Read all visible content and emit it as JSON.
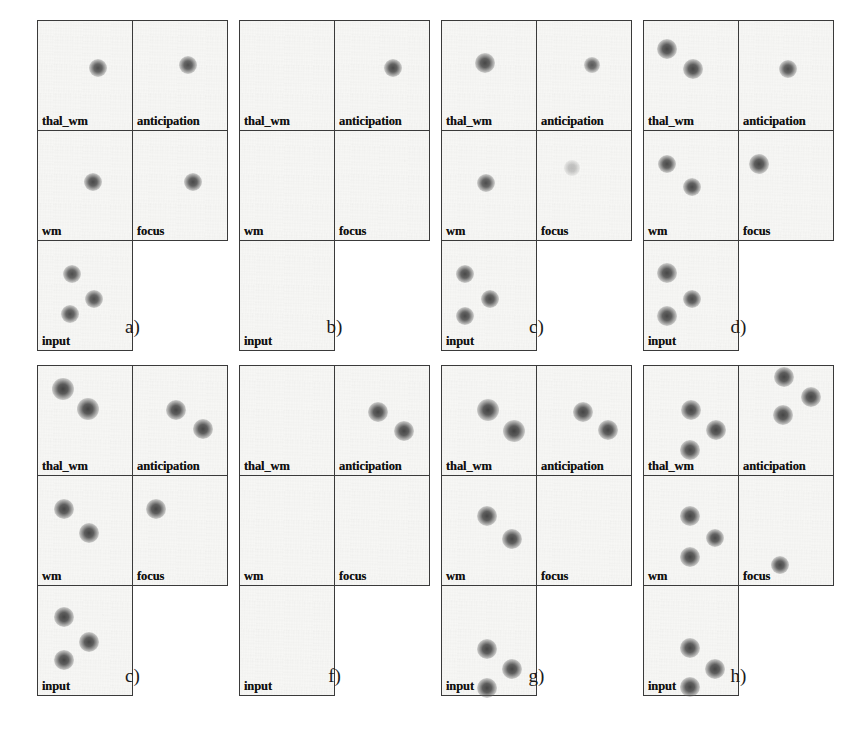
{
  "figure": {
    "cell_labels": [
      "thal_wm",
      "anticipation",
      "wm",
      "focus",
      "input"
    ],
    "blob_color": "#4a4a4a",
    "border_color": "#3a3a3a",
    "background_color": "#f7f7f5"
  },
  "chart_data": {
    "type": "scatter",
    "xlabel": "",
    "ylabel": "",
    "xlim": [
      0,
      100
    ],
    "ylim": [
      0,
      100
    ],
    "grid": false,
    "legend": "none",
    "modules": [
      "thal_wm",
      "anticipation",
      "wm",
      "focus",
      "input"
    ],
    "panels": [
      {
        "caption": "a)",
        "cells": [
          {
            "module": "thal_wm",
            "points": [
              {
                "x": 62,
                "y": 42,
                "r": 9,
                "i": 0.82
              }
            ]
          },
          {
            "module": "anticipation",
            "points": [
              {
                "x": 57,
                "y": 40,
                "r": 9,
                "i": 0.82
              }
            ]
          },
          {
            "module": "wm",
            "points": [
              {
                "x": 57,
                "y": 46,
                "r": 9,
                "i": 0.84
              }
            ]
          },
          {
            "module": "focus",
            "points": [
              {
                "x": 62,
                "y": 46,
                "r": 9,
                "i": 0.84
              }
            ]
          },
          {
            "module": "input",
            "points": [
              {
                "x": 35,
                "y": 30,
                "r": 9,
                "i": 0.82
              },
              {
                "x": 58,
                "y": 52,
                "r": 9,
                "i": 0.82
              },
              {
                "x": 33,
                "y": 66,
                "r": 9,
                "i": 0.82
              }
            ]
          }
        ]
      },
      {
        "caption": "b)",
        "cells": [
          {
            "module": "thal_wm",
            "points": []
          },
          {
            "module": "anticipation",
            "points": [
              {
                "x": 60,
                "y": 42,
                "r": 9,
                "i": 0.84
              }
            ]
          },
          {
            "module": "wm",
            "points": []
          },
          {
            "module": "focus",
            "points": []
          },
          {
            "module": "input",
            "points": []
          }
        ]
      },
      {
        "caption": "c)",
        "cells": [
          {
            "module": "thal_wm",
            "points": [
              {
                "x": 45,
                "y": 38,
                "r": 10,
                "i": 0.85
              }
            ]
          },
          {
            "module": "anticipation",
            "points": [
              {
                "x": 57,
                "y": 40,
                "r": 8,
                "i": 0.76
              }
            ]
          },
          {
            "module": "wm",
            "points": [
              {
                "x": 46,
                "y": 47,
                "r": 9,
                "i": 0.82
              }
            ]
          },
          {
            "module": "focus",
            "points": [
              {
                "x": 36,
                "y": 33,
                "r": 8,
                "i": 0.28
              }
            ]
          },
          {
            "module": "input",
            "points": [
              {
                "x": 24,
                "y": 30,
                "r": 9,
                "i": 0.84
              },
              {
                "x": 50,
                "y": 52,
                "r": 9,
                "i": 0.84
              },
              {
                "x": 24,
                "y": 68,
                "r": 9,
                "i": 0.84
              }
            ]
          }
        ]
      },
      {
        "caption": "d)",
        "cells": [
          {
            "module": "thal_wm",
            "points": [
              {
                "x": 24,
                "y": 25,
                "r": 10,
                "i": 0.86
              },
              {
                "x": 51,
                "y": 43,
                "r": 10,
                "i": 0.86
              }
            ]
          },
          {
            "module": "anticipation",
            "points": [
              {
                "x": 51,
                "y": 43,
                "r": 9,
                "i": 0.82
              }
            ]
          },
          {
            "module": "wm",
            "points": [
              {
                "x": 24,
                "y": 30,
                "r": 9,
                "i": 0.84
              },
              {
                "x": 50,
                "y": 50,
                "r": 9,
                "i": 0.84
              }
            ]
          },
          {
            "module": "focus",
            "points": [
              {
                "x": 21,
                "y": 30,
                "r": 10,
                "i": 0.86
              }
            ]
          },
          {
            "module": "input",
            "points": [
              {
                "x": 24,
                "y": 29,
                "r": 10,
                "i": 0.85
              },
              {
                "x": 50,
                "y": 52,
                "r": 9,
                "i": 0.84
              },
              {
                "x": 24,
                "y": 68,
                "r": 10,
                "i": 0.85
              }
            ]
          }
        ]
      },
      {
        "caption": "c)",
        "cells": [
          {
            "module": "thal_wm",
            "points": [
              {
                "x": 26,
                "y": 21,
                "r": 11,
                "i": 0.88
              },
              {
                "x": 52,
                "y": 39,
                "r": 11,
                "i": 0.88
              }
            ]
          },
          {
            "module": "anticipation",
            "points": [
              {
                "x": 45,
                "y": 40,
                "r": 10,
                "i": 0.86
              },
              {
                "x": 73,
                "y": 57,
                "r": 10,
                "i": 0.86
              }
            ]
          },
          {
            "module": "wm",
            "points": [
              {
                "x": 27,
                "y": 30,
                "r": 10,
                "i": 0.86
              },
              {
                "x": 53,
                "y": 51,
                "r": 10,
                "i": 0.86
              }
            ]
          },
          {
            "module": "focus",
            "points": [
              {
                "x": 24,
                "y": 30,
                "r": 10,
                "i": 0.86
              }
            ]
          },
          {
            "module": "input",
            "points": [
              {
                "x": 27,
                "y": 28,
                "r": 10,
                "i": 0.86
              },
              {
                "x": 53,
                "y": 50,
                "r": 10,
                "i": 0.86
              },
              {
                "x": 27,
                "y": 67,
                "r": 10,
                "i": 0.86
              }
            ]
          }
        ]
      },
      {
        "caption": "f)",
        "cells": [
          {
            "module": "thal_wm",
            "points": []
          },
          {
            "module": "anticipation",
            "points": [
              {
                "x": 45,
                "y": 41,
                "r": 10,
                "i": 0.86
              },
              {
                "x": 72,
                "y": 59,
                "r": 10,
                "i": 0.86
              }
            ]
          },
          {
            "module": "wm",
            "points": []
          },
          {
            "module": "focus",
            "points": []
          },
          {
            "module": "input",
            "points": []
          }
        ]
      },
      {
        "caption": "g)",
        "cells": [
          {
            "module": "thal_wm",
            "points": [
              {
                "x": 48,
                "y": 40,
                "r": 11,
                "i": 0.88
              },
              {
                "x": 75,
                "y": 59,
                "r": 11,
                "i": 0.88
              }
            ]
          },
          {
            "module": "anticipation",
            "points": [
              {
                "x": 48,
                "y": 41,
                "r": 10,
                "i": 0.86
              },
              {
                "x": 74,
                "y": 58,
                "r": 10,
                "i": 0.86
              }
            ]
          },
          {
            "module": "wm",
            "points": [
              {
                "x": 47,
                "y": 36,
                "r": 10,
                "i": 0.86
              },
              {
                "x": 73,
                "y": 57,
                "r": 10,
                "i": 0.86
              }
            ]
          },
          {
            "module": "focus",
            "points": []
          },
          {
            "module": "input",
            "points": [
              {
                "x": 47,
                "y": 57,
                "r": 10,
                "i": 0.86
              },
              {
                "x": 73,
                "y": 75,
                "r": 10,
                "i": 0.86
              },
              {
                "x": 47,
                "y": 92,
                "r": 10,
                "i": 0.86
              }
            ]
          }
        ]
      },
      {
        "caption": "h)",
        "cells": [
          {
            "module": "thal_wm",
            "points": [
              {
                "x": 49,
                "y": 40,
                "r": 10,
                "i": 0.86
              },
              {
                "x": 75,
                "y": 58,
                "r": 10,
                "i": 0.86
              },
              {
                "x": 48,
                "y": 76,
                "r": 10,
                "i": 0.86
              }
            ]
          },
          {
            "module": "anticipation",
            "points": [
              {
                "x": 47,
                "y": 10,
                "r": 10,
                "i": 0.86
              },
              {
                "x": 75,
                "y": 28,
                "r": 10,
                "i": 0.86
              },
              {
                "x": 46,
                "y": 44,
                "r": 10,
                "i": 0.86
              }
            ]
          },
          {
            "module": "wm",
            "points": [
              {
                "x": 48,
                "y": 36,
                "r": 10,
                "i": 0.86
              },
              {
                "x": 74,
                "y": 56,
                "r": 9,
                "i": 0.84
              },
              {
                "x": 48,
                "y": 73,
                "r": 10,
                "i": 0.86
              }
            ]
          },
          {
            "module": "focus",
            "points": [
              {
                "x": 43,
                "y": 80,
                "r": 9,
                "i": 0.84
              }
            ]
          },
          {
            "module": "input",
            "points": [
              {
                "x": 48,
                "y": 56,
                "r": 10,
                "i": 0.86
              },
              {
                "x": 74,
                "y": 75,
                "r": 10,
                "i": 0.86
              },
              {
                "x": 48,
                "y": 91,
                "r": 10,
                "i": 0.86
              }
            ]
          }
        ]
      }
    ]
  }
}
